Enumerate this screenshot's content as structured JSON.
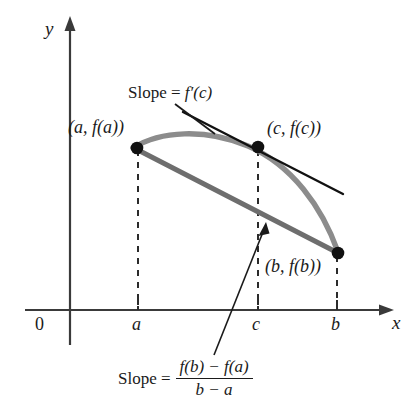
{
  "figure": {
    "axes": {
      "y_label": "y",
      "x_label": "x",
      "origin_label": "0",
      "x_ticks": [
        "a",
        "c",
        "b"
      ]
    },
    "points": [
      {
        "name": "point-a",
        "label": "(a, f(a))"
      },
      {
        "name": "point-c",
        "label": "(c, f(c))"
      },
      {
        "name": "point-b",
        "label": "(b, f(b))"
      }
    ],
    "tangent_annotation": {
      "prefix": "Slope = ",
      "expression": "f′(c)"
    },
    "secant_annotation": {
      "prefix": "Slope = ",
      "numerator": "f(b) − f(a)",
      "denominator": "b − a"
    },
    "colors": {
      "curve": "#8c8c8c",
      "secant": "#6e6e6e",
      "tangent": "#111111",
      "axis": "#3a3a3a",
      "dashed": "#2b2b2b",
      "text": "#1a1a1a"
    }
  }
}
